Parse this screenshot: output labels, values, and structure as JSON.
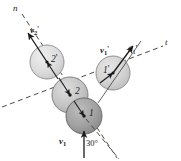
{
  "figure": {
    "width": 181,
    "height": 161,
    "background": "#ffffff",
    "line_color": "#1a1a1a",
    "dash_color": "#4a4a4a"
  },
  "axes": [
    {
      "id": "n-axis",
      "label": "n",
      "label_x": 15,
      "label_y": 6,
      "style": "dashed",
      "x1": 22,
      "y1": 14,
      "x2": 117,
      "y2": 158,
      "description": "line of impact (normal axis)"
    },
    {
      "id": "t-axis",
      "label": "t",
      "label_x": 166,
      "label_y": 39,
      "style": "dashed",
      "x1": 2,
      "y1": 107,
      "x2": 163,
      "y2": 46,
      "description": "tangent axis perpendicular to line of impact"
    }
  ],
  "balls": [
    {
      "id": "ball-2-prime",
      "label": "2",
      "prime": "'",
      "cx": 47,
      "cy": 62,
      "r": 17,
      "fill": "#d8d8d8",
      "stroke": "#7a7a7a",
      "label_x": 51,
      "label_y": 57,
      "dot": true,
      "state": "after-impact"
    },
    {
      "id": "ball-2",
      "label": "2",
      "prime": "",
      "cx": 70,
      "cy": 95,
      "r": 18,
      "fill": "#c0c0c0",
      "stroke": "#6e6e6e",
      "label_x": 74,
      "label_y": 90,
      "dot": true,
      "state": "before-impact"
    },
    {
      "id": "ball-1",
      "label": "1",
      "prime": "",
      "cx": 84,
      "cy": 116,
      "r": 18,
      "fill": "#9e9e9e",
      "stroke": "#5a5a5a",
      "label_x": 88,
      "label_y": 111,
      "dot": true,
      "state": "before-impact"
    },
    {
      "id": "ball-1-prime",
      "label": "1",
      "prime": "'",
      "cx": 113,
      "cy": 73,
      "r": 17,
      "fill": "#d0d0d0",
      "stroke": "#767676",
      "label_x": 105,
      "label_y": 68,
      "dot": true,
      "state": "after-impact"
    }
  ],
  "vectors": [
    {
      "id": "v1",
      "name": "v",
      "sub": "1",
      "prime": "",
      "label_x": 62,
      "label_y": 139,
      "x1": 84,
      "y1": 157,
      "x2": 84,
      "y2": 129,
      "description": "initial velocity of ball 1, vertical upward"
    },
    {
      "id": "v1-prime",
      "name": "v",
      "sub": "1",
      "prime": "'",
      "label_x": 103,
      "label_y": 47,
      "x1": 113,
      "y1": 73,
      "x2": 134,
      "y2": 45,
      "description": "velocity of ball 1 after impact"
    },
    {
      "id": "v2-prime",
      "name": "v",
      "sub": "2",
      "prime": "'",
      "label_x": 33,
      "label_y": 28,
      "x1": 47,
      "y1": 62,
      "x2": 27,
      "y2": 32,
      "description": "velocity of ball 2 after impact, along n axis"
    }
  ],
  "angles": [
    {
      "id": "theta-1-prime",
      "symbol": "θ",
      "sub": "1",
      "prime": "'",
      "label_x": 130,
      "label_y": 46,
      "description": "angle of v1' from the t axis"
    },
    {
      "id": "angle-30",
      "value": "30°",
      "label_x": 88,
      "label_y": 140,
      "description": "angle between v1 and the line of impact"
    }
  ],
  "guide_lines": [
    {
      "id": "impact-guide-lower",
      "x1": 84,
      "y1": 116,
      "x2": 118,
      "y2": 159,
      "style": "dashed",
      "description": "lower extension of line of impact past ball 1"
    }
  ]
}
